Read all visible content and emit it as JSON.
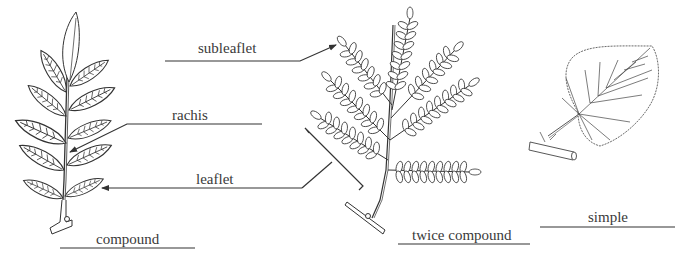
{
  "figure": {
    "labels": {
      "subleaflet": "subleaflet",
      "rachis": "rachis",
      "leaflet": "leaflet",
      "compound": "compound",
      "twice_compound": "twice compound",
      "simple": "simple"
    },
    "leaf_types": [
      {
        "name": "compound",
        "parts": [
          "rachis",
          "leaflet"
        ]
      },
      {
        "name": "twice compound",
        "parts": [
          "subleaflet",
          "leaflet"
        ]
      },
      {
        "name": "simple",
        "parts": []
      }
    ],
    "colors": {
      "ink": "#3a3a3a",
      "background": "#ffffff"
    }
  }
}
